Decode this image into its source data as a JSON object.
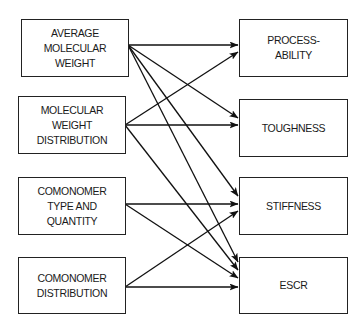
{
  "diagram": {
    "inputs": [
      {
        "id": "avg_mw",
        "label": "AVERAGE\nMOLECULAR\nWEIGHT"
      },
      {
        "id": "mwd",
        "label": "MOLECULAR\nWEIGHT\nDISTRIBUTION"
      },
      {
        "id": "comonomer_type",
        "label": "COMONOMER\nTYPE AND\nQUANTITY"
      },
      {
        "id": "comonomer_dist",
        "label": "COMONOMER\nDISTRIBUTION"
      }
    ],
    "outputs": [
      {
        "id": "processability",
        "label": "PROCESS-\nABILITY"
      },
      {
        "id": "toughness",
        "label": "TOUGHNESS"
      },
      {
        "id": "stiffness",
        "label": "STIFFNESS"
      },
      {
        "id": "escr",
        "label": "ESCR"
      }
    ],
    "edges": [
      {
        "from": "avg_mw",
        "to": "processability"
      },
      {
        "from": "avg_mw",
        "to": "toughness"
      },
      {
        "from": "avg_mw",
        "to": "stiffness"
      },
      {
        "from": "avg_mw",
        "to": "escr"
      },
      {
        "from": "mwd",
        "to": "processability"
      },
      {
        "from": "mwd",
        "to": "toughness"
      },
      {
        "from": "mwd",
        "to": "escr"
      },
      {
        "from": "comonomer_type",
        "to": "stiffness"
      },
      {
        "from": "comonomer_type",
        "to": "escr"
      },
      {
        "from": "comonomer_dist",
        "to": "stiffness"
      },
      {
        "from": "comonomer_dist",
        "to": "escr"
      }
    ]
  }
}
